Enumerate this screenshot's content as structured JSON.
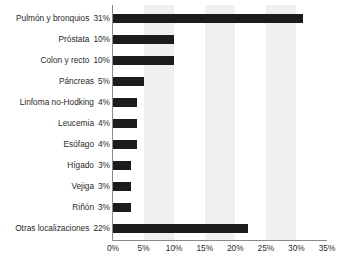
{
  "chart_data": {
    "type": "bar",
    "orientation": "horizontal",
    "title": "",
    "xlabel": "",
    "ylabel": "",
    "xlim": [
      0,
      35
    ],
    "xtick_labels": [
      "0%",
      "5%",
      "10%",
      "15%",
      "20%",
      "25%",
      "30%",
      "35%"
    ],
    "xtick_values": [
      0,
      5,
      10,
      15,
      20,
      25,
      30,
      35
    ],
    "grid": false,
    "legend": false,
    "alternating_bands": true,
    "bar_color": "#1c1c1c",
    "band_color": "#f0f0f0",
    "categories": [
      "Pulmón y bronquios",
      "Próstata",
      "Colon y recto",
      "Páncreas",
      "Linfoma no-Hodking",
      "Leucemia",
      "Esófago",
      "Hígado",
      "Vejiga",
      "Riñón",
      "Otras localizaciones"
    ],
    "values": [
      31,
      10,
      10,
      5,
      4,
      4,
      4,
      3,
      3,
      3,
      22
    ],
    "value_labels": [
      "31%",
      "10%",
      "10%",
      "5%",
      "4%",
      "4%",
      "4%",
      "3%",
      "3%",
      "3%",
      "22%"
    ],
    "rows": [
      {
        "category": "Pulmón y bronquios",
        "value": 31,
        "value_label": "31%"
      },
      {
        "category": "Próstata",
        "value": 10,
        "value_label": "10%"
      },
      {
        "category": "Colon y recto",
        "value": 10,
        "value_label": "10%"
      },
      {
        "category": "Páncreas",
        "value": 5,
        "value_label": "5%"
      },
      {
        "category": "Linfoma no-Hodking",
        "value": 4,
        "value_label": "4%"
      },
      {
        "category": "Leucemia",
        "value": 4,
        "value_label": "4%"
      },
      {
        "category": "Esófago",
        "value": 4,
        "value_label": "4%"
      },
      {
        "category": "Hígado",
        "value": 3,
        "value_label": "3%"
      },
      {
        "category": "Vejiga",
        "value": 3,
        "value_label": "3%"
      },
      {
        "category": "Riñón",
        "value": 3,
        "value_label": "3%"
      },
      {
        "category": "Otras localizaciones",
        "value": 22,
        "value_label": "22%"
      }
    ]
  }
}
